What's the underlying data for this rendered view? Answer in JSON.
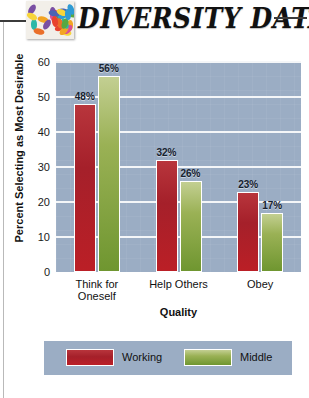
{
  "header": {
    "title": "DIVERSITY DATA",
    "logo_icon": "confetti-pills-logo"
  },
  "chart_data": {
    "type": "bar",
    "title": "",
    "categories": [
      "Think for Oneself",
      "Help Others",
      "Obey"
    ],
    "series": [
      {
        "name": "Working",
        "color": "#a5202a",
        "values": [
          48,
          32,
          23
        ],
        "labels": [
          "48%",
          "32%",
          "23%"
        ]
      },
      {
        "name": "Middle",
        "color": "#7a9a3c",
        "values": [
          56,
          26,
          17
        ],
        "labels": [
          "56%",
          "26%",
          "17%"
        ]
      }
    ],
    "xlabel": "Quality",
    "ylabel": "Percent Selecting as Most Desirable",
    "ylim": [
      0,
      60
    ],
    "yticks": [
      0,
      10,
      20,
      30,
      40,
      50,
      60
    ],
    "ytick_labels": [
      "0",
      "10",
      "20",
      "30",
      "40",
      "50",
      "60"
    ],
    "grid": true,
    "legend_position": "bottom",
    "plot_background": "#9badc4",
    "gridline_color": "#f4f6f8"
  },
  "caption": {
    "text": ""
  }
}
